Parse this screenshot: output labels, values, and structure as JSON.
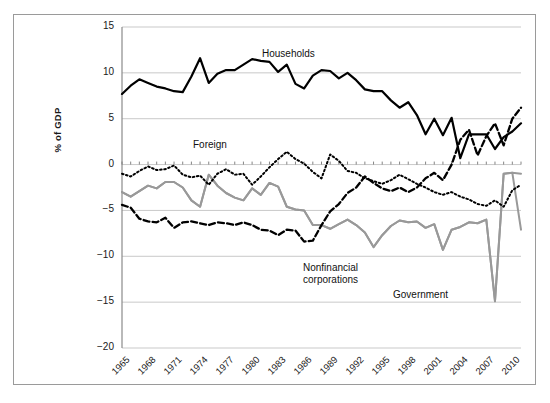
{
  "figure": {
    "background": "#ffffff",
    "frame_color": "#9a9a9a"
  },
  "chart_data": {
    "type": "line",
    "title": "",
    "subtitle": "",
    "xlabel": "",
    "ylabel": "% of GDP",
    "xlim": [
      1965,
      2011
    ],
    "ylim": [
      -20,
      15
    ],
    "ytick_values": [
      15,
      10,
      5,
      0,
      -5,
      -10,
      -15,
      -20
    ],
    "ytick_labels": [
      "15",
      "10",
      "5",
      "0",
      "−5",
      "−10",
      "−15",
      "−20"
    ],
    "xtick_values": [
      1965,
      1968,
      1971,
      1974,
      1977,
      1980,
      1983,
      1986,
      1989,
      1992,
      1995,
      1998,
      2001,
      2004,
      2007,
      2010
    ],
    "xtick_labels": [
      "1965",
      "1968",
      "1971",
      "1974",
      "1977",
      "1980",
      "1983",
      "1986",
      "1989",
      "1992",
      "1995",
      "1998",
      "2001",
      "2004",
      "2007",
      "2010"
    ],
    "grid": "horizontal",
    "grid_color": "#c9c9c9",
    "legend_position": "inline-annotations",
    "x": [
      1965,
      1966,
      1967,
      1968,
      1969,
      1970,
      1971,
      1972,
      1973,
      1974,
      1975,
      1976,
      1977,
      1978,
      1979,
      1980,
      1981,
      1982,
      1983,
      1984,
      1985,
      1986,
      1987,
      1988,
      1989,
      1990,
      1991,
      1992,
      1993,
      1994,
      1995,
      1996,
      1997,
      1998,
      1999,
      2000,
      2001,
      2002,
      2003,
      2004,
      2005,
      2006,
      2007,
      2008,
      2009,
      2010,
      2011
    ],
    "series": [
      {
        "name": "Households",
        "color": "#000000",
        "style": "solid",
        "width": 2.2,
        "label_text": "Households",
        "values": [
          7.7,
          8.6,
          9.3,
          8.9,
          8.5,
          8.3,
          8.0,
          7.9,
          9.6,
          11.6,
          8.9,
          9.9,
          10.3,
          10.3,
          10.9,
          11.5,
          11.3,
          11.2,
          10.1,
          10.9,
          8.8,
          8.3,
          9.7,
          10.3,
          10.2,
          9.4,
          10.0,
          9.2,
          8.2,
          8.0,
          8.0,
          7.0,
          6.2,
          6.8,
          5.4,
          3.3,
          5.0,
          3.2,
          5.1,
          0.7,
          3.3,
          3.3,
          3.3,
          1.7,
          3.0,
          3.6,
          4.5
        ]
      },
      {
        "name": "Nonfinancial corporations",
        "color": "#999999",
        "style": "solid",
        "width": 2.0,
        "label_text": "Nonfinancial\ncorporations",
        "values": [
          -3.0,
          -3.5,
          -2.9,
          -2.3,
          -2.6,
          -1.9,
          -1.9,
          -2.5,
          -3.9,
          -4.6,
          -1.1,
          -2.3,
          -3.1,
          -3.6,
          -3.9,
          -2.6,
          -3.3,
          -2.0,
          -2.4,
          -4.6,
          -4.9,
          -5.0,
          -6.6,
          -6.6,
          -7.0,
          -6.5,
          -6.0,
          -6.6,
          -7.4,
          -9.0,
          -7.7,
          -6.7,
          -6.1,
          -6.3,
          -6.2,
          -6.9,
          -6.5,
          -9.3,
          -7.1,
          -6.8,
          -6.3,
          -6.4,
          -6.0,
          -14.9,
          -1.0,
          -0.9,
          -1.0
        ]
      },
      {
        "name": "Government",
        "color": "#999999",
        "style": "solid",
        "width": 2.0,
        "label_text": "Government",
        "values": [
          -3.0,
          -3.5,
          -2.9,
          -2.3,
          -2.6,
          -1.9,
          -1.9,
          -2.5,
          -3.9,
          -4.6,
          -1.1,
          -2.3,
          -3.1,
          -3.6,
          -3.9,
          -2.6,
          -3.3,
          -2.0,
          -2.4,
          -4.6,
          -4.9,
          -5.0,
          -6.6,
          -6.6,
          -7.0,
          -6.5,
          -6.0,
          -6.6,
          -7.4,
          -9.0,
          -7.7,
          -6.7,
          -6.1,
          -6.3,
          -6.2,
          -6.9,
          -6.5,
          -9.3,
          -7.1,
          -6.8,
          -6.3,
          -6.4,
          -6.0,
          -14.9,
          -1.0,
          -0.9,
          -7.1
        ]
      },
      {
        "name": "Foreign",
        "color": "#000000",
        "style": "dotted",
        "width": 2.0,
        "label_text": "Foreign",
        "values": [
          -1.0,
          -1.3,
          -0.7,
          -0.2,
          -0.6,
          -0.5,
          -0.1,
          -1.1,
          -1.4,
          -1.2,
          -2.2,
          -1.0,
          -0.5,
          -1.1,
          -1.0,
          -2.2,
          -1.3,
          -0.3,
          0.6,
          1.4,
          0.6,
          0.1,
          -0.8,
          -1.5,
          1.1,
          0.4,
          -0.7,
          -0.9,
          -1.5,
          -1.8,
          -2.1,
          -1.7,
          -1.1,
          -1.6,
          -2.1,
          -2.5,
          -3.0,
          -3.3,
          -3.0,
          -3.5,
          -3.8,
          -4.3,
          -4.5,
          -3.9,
          -4.6,
          -2.8,
          -2.2
        ]
      },
      {
        "name": "Government dashed",
        "color": "#000000",
        "style": "dashed",
        "width": 2.3,
        "label_text": "",
        "values": [
          -4.4,
          -4.7,
          -5.9,
          -6.2,
          -6.3,
          -5.8,
          -6.9,
          -6.3,
          -6.2,
          -6.4,
          -6.6,
          -6.3,
          -6.4,
          -6.6,
          -6.3,
          -6.6,
          -7.1,
          -7.2,
          -7.7,
          -7.1,
          -7.2,
          -8.4,
          -8.3,
          -6.6,
          -5.1,
          -4.3,
          -3.1,
          -2.5,
          -1.3,
          -2.0,
          -2.6,
          -2.9,
          -2.5,
          -3.0,
          -2.5,
          -1.5,
          -0.9,
          -1.7,
          0.0,
          2.7,
          3.8,
          1.0,
          3.1,
          4.5,
          2.1,
          5.0,
          6.2
        ]
      }
    ],
    "annotations": [
      {
        "text": "Households",
        "x_px": 262,
        "y_px": 48
      },
      {
        "text": "Foreign",
        "x_px": 193,
        "y_px": 139
      },
      {
        "text": "Nonfinancial",
        "x_px": 303,
        "y_px": 262
      },
      {
        "text": "corporations",
        "x_px": 303,
        "y_px": 274
      },
      {
        "text": "Government",
        "x_px": 393,
        "y_px": 289
      }
    ]
  }
}
